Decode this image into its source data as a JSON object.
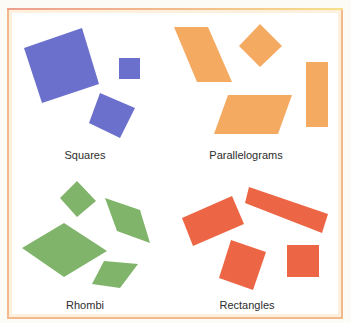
{
  "header": {
    "clipped_text": ""
  },
  "colors": {
    "squares": "#6b70cc",
    "parallelograms": "#f5aa62",
    "rhombi": "#7fb46a",
    "rectangles": "#ec6544",
    "frame": "#f2b98c",
    "frame_fill": "#fdf1dd"
  },
  "panels": [
    {
      "label": "Squares",
      "shapes": [
        {
          "points": "24,48 82,28 99,84 42,103"
        },
        {
          "points": "119,58 140,58 140,79 119,79"
        },
        {
          "points": "100,93 135,108 120,138 89,123"
        }
      ]
    },
    {
      "label": "Parallelograms",
      "shapes": [
        {
          "points": "174,27 208,27 232,82 197,82"
        },
        {
          "points": "260,24 282,46 260,67 239,46"
        },
        {
          "points": "228,95 292,95 278,134 214,134"
        },
        {
          "points": "306,62 328,62 328,127 306,127"
        }
      ]
    },
    {
      "label": "Rhombi",
      "shapes": [
        {
          "points": "77,181 96,201 77,217 60,198"
        },
        {
          "points": "105,198 140,210 150,243 117,231"
        },
        {
          "points": "64,223 107,251 64,277 22,248"
        },
        {
          "points": "104,261 138,264 120,288 92,284"
        }
      ]
    },
    {
      "label": "Rectangles",
      "shapes": [
        {
          "points": "182,218 232,196 244,224 193,246"
        },
        {
          "points": "249,187 328,214 322,233 245,203"
        },
        {
          "points": "231,240 266,252 253,290 219,278"
        },
        {
          "points": "287,245 319,245 319,277 287,277"
        }
      ]
    }
  ]
}
